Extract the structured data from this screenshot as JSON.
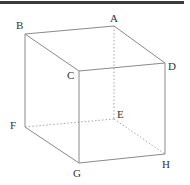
{
  "diagram": {
    "type": "cube",
    "colors": {
      "top_border": "#3a3a3a",
      "edge": "#8a8a8a",
      "hidden_edge": "#a8a8a8",
      "label": "#333333"
    },
    "vertices": {
      "A": {
        "label": "A",
        "x": 114,
        "y": 26,
        "label_x": 110,
        "label_y": 22
      },
      "B": {
        "label": "B",
        "x": 25,
        "y": 34,
        "label_x": 16,
        "label_y": 29
      },
      "C": {
        "label": "C",
        "x": 79,
        "y": 71,
        "label_x": 67,
        "label_y": 79
      },
      "D": {
        "label": "D",
        "x": 165,
        "y": 63,
        "label_x": 168,
        "label_y": 70
      },
      "E": {
        "label": "E",
        "x": 114,
        "y": 119,
        "label_x": 117,
        "label_y": 118
      },
      "F": {
        "label": "F",
        "x": 25,
        "y": 127,
        "label_x": 10,
        "label_y": 129
      },
      "G": {
        "label": "G",
        "x": 79,
        "y": 163,
        "label_x": 73,
        "label_y": 177
      },
      "H": {
        "label": "H",
        "x": 165,
        "y": 154,
        "label_x": 162,
        "label_y": 168
      }
    },
    "solid_edges": [
      [
        "A",
        "B"
      ],
      [
        "B",
        "C"
      ],
      [
        "C",
        "D"
      ],
      [
        "D",
        "A"
      ],
      [
        "B",
        "F"
      ],
      [
        "C",
        "G"
      ],
      [
        "D",
        "H"
      ],
      [
        "F",
        "G"
      ],
      [
        "G",
        "H"
      ]
    ],
    "hidden_edges": [
      [
        "A",
        "E"
      ],
      [
        "E",
        "F"
      ],
      [
        "E",
        "H"
      ]
    ]
  }
}
